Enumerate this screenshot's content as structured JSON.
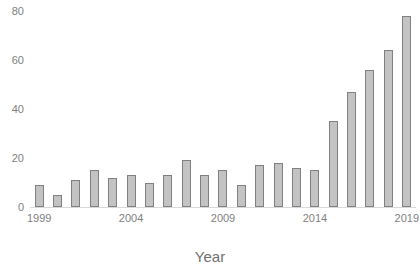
{
  "chart_data": {
    "type": "bar",
    "title": "",
    "subtitle": "",
    "xlabel": "Year",
    "ylabel": "",
    "grid": false,
    "legend": null,
    "xlim": [
      1998.5,
      2019.5
    ],
    "ylim": [
      0,
      80
    ],
    "yticks": [
      0,
      20,
      40,
      60,
      80
    ],
    "ytick_labels": [
      "0",
      "20",
      "40",
      "60",
      "80"
    ],
    "xticks": [
      1999,
      2004,
      2009,
      2014,
      2019
    ],
    "xtick_labels": [
      "1999",
      "2004",
      "2009",
      "2014",
      "2019"
    ],
    "categories": [
      "1999",
      "2000",
      "2001",
      "2002",
      "2003",
      "2004",
      "2005",
      "2006",
      "2007",
      "2008",
      "2009",
      "2010",
      "2011",
      "2012",
      "2013",
      "2014",
      "2015",
      "2016",
      "2017",
      "2018",
      "2019"
    ],
    "values": [
      9,
      5,
      11,
      15,
      12,
      13,
      10,
      13,
      19,
      13,
      15,
      9,
      17,
      18,
      16,
      15,
      35,
      47,
      56,
      64,
      78
    ],
    "bar_fill_color": "#c3c3c3",
    "bar_edge_color": "#808080",
    "axis_color": "#d9d9d9",
    "tick_label_color": "#808080",
    "axis_title_color": "#6f6f6f",
    "background_color": "#ffffff"
  }
}
